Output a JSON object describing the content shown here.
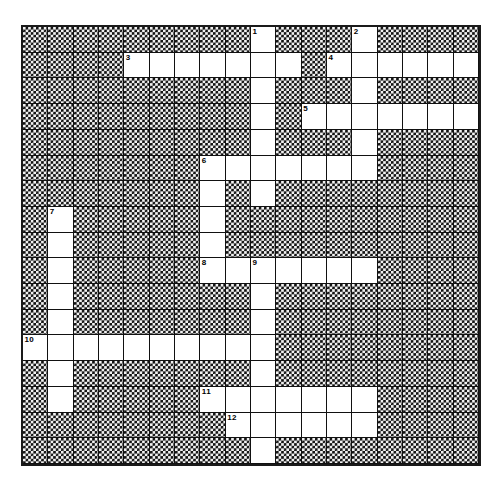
{
  "puzzle": {
    "title": "Crossword Puzzle Grid",
    "columns": 18,
    "rows": 17,
    "cell_size_px": 23.2,
    "colors": {
      "open_cell": "#ffffff",
      "block_pattern_dark": "#111111",
      "block_pattern_light": "#f2f2f2",
      "grid_line": "#111111",
      "number_text": "#000000",
      "page_background": "#ffffff"
    },
    "numbered_clues": [
      {
        "number": "1",
        "row": 0,
        "col": 9,
        "direction": "down"
      },
      {
        "number": "2",
        "row": 0,
        "col": 13,
        "direction": "down"
      },
      {
        "number": "3",
        "row": 1,
        "col": 4,
        "direction": "across"
      },
      {
        "number": "4",
        "row": 1,
        "col": 12,
        "direction": "across"
      },
      {
        "number": "5",
        "row": 3,
        "col": 11,
        "direction": "across"
      },
      {
        "number": "6",
        "row": 5,
        "col": 7,
        "direction": "across-down"
      },
      {
        "number": "7",
        "row": 7,
        "col": 1,
        "direction": "down"
      },
      {
        "number": "8",
        "row": 9,
        "col": 7,
        "direction": "across"
      },
      {
        "number": "9",
        "row": 9,
        "col": 9,
        "direction": "across-down"
      },
      {
        "number": "10",
        "row": 12,
        "col": 0,
        "direction": "across"
      },
      {
        "number": "11",
        "row": 14,
        "col": 7,
        "direction": "across"
      },
      {
        "number": "12",
        "row": 15,
        "col": 8,
        "direction": "across"
      }
    ],
    "grid": [
      "XXXXXXXXXOXXXOXXXX",
      "XXXXOOOOOOOXOOOOOO",
      "XXXXXXXXXOXXXOXXXX",
      "XXXXXXXXXOXOOOOOOO",
      "XXXXXXXXXOXXXOXXXX",
      "XXXXXXXOOOOOOOXXXX",
      "XXXXXXXOXOXXXXXXXX",
      "XOXXXXXOXXXXXXXXXX",
      "XOXXXXXOXXXXXXXXXX",
      "XOXXXXXOOOOOOOXXXX",
      "XOXXXXXXXOXXXXXXXX",
      "XOXXXXXXXOXXXXXXXX",
      "OOOOOOOOOOXXXXXXXX",
      "XOXXXXXXXOXXXXXXXX",
      "XOXXXXXOOOOOOOXXXX",
      "XXXXXXXXOOOOOOXXXX",
      "XXXXXXXXXOXXXXXXXX"
    ],
    "legend": {
      "O": "open-answer-square",
      "X": "blocked-square"
    },
    "letters": {}
  }
}
